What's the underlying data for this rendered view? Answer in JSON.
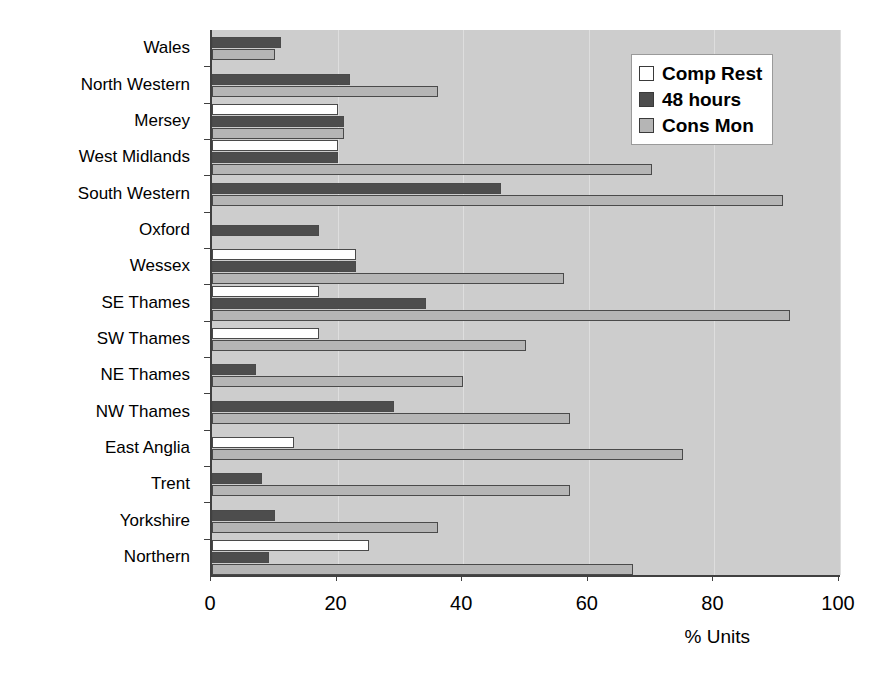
{
  "chart_data": {
    "type": "bar",
    "orientation": "horizontal",
    "title": "",
    "xlabel": "% Units",
    "ylabel": "",
    "xlim": [
      0,
      100
    ],
    "xticks": [
      0,
      20,
      40,
      60,
      80,
      100
    ],
    "grid": true,
    "legend_position": "top-right",
    "categories": [
      "Wales",
      "North Western",
      "Mersey",
      "West Midlands",
      "South Western",
      "Oxford",
      "Wessex",
      "SE Thames",
      "SW Thames",
      "NE Thames",
      "NW Thames",
      "East Anglia",
      "Trent",
      "Yorkshire",
      "Northern"
    ],
    "series": [
      {
        "name": "Comp Rest",
        "color": "#ffffff",
        "values": [
          0,
          0,
          20,
          20,
          0,
          0,
          23,
          17,
          17,
          0,
          0,
          13,
          0,
          0,
          25
        ]
      },
      {
        "name": "48 hours",
        "color": "#4d4d4d",
        "values": [
          11,
          22,
          21,
          20,
          46,
          17,
          23,
          34,
          0,
          7,
          29,
          0,
          8,
          10,
          9
        ]
      },
      {
        "name": "Cons Mon",
        "color": "#b5b5b5",
        "values": [
          10,
          36,
          21,
          70,
          91,
          0,
          56,
          92,
          50,
          40,
          57,
          75,
          57,
          36,
          67
        ]
      }
    ]
  },
  "legend": {
    "entries": [
      {
        "label": "Comp Rest",
        "key": "comp-rest"
      },
      {
        "label": "48 hours",
        "key": "48-hours"
      },
      {
        "label": "Cons Mon",
        "key": "cons-mon"
      }
    ]
  },
  "axis": {
    "x_title": "% Units",
    "x_tick_labels": [
      "0",
      "20",
      "40",
      "60",
      "80",
      "100"
    ]
  },
  "colors": {
    "plot_background": "#cdcdcd",
    "gridline": "#dedede",
    "axis": "#404040",
    "series_comp_rest": "#ffffff",
    "series_48_hours": "#4d4d4d",
    "series_cons_mon": "#b5b5b5"
  }
}
